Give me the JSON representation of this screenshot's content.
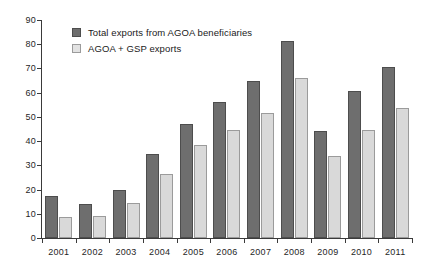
{
  "chart_data": {
    "type": "bar",
    "title": "",
    "subtitle": "",
    "xlabel": "",
    "ylabel": "",
    "categories": [
      "2001",
      "2002",
      "2003",
      "2004",
      "2005",
      "2006",
      "2007",
      "2008",
      "2009",
      "2010",
      "2011"
    ],
    "series": [
      {
        "name": "Total exports from AGOA beneficiaries",
        "color": "#6e6e6e",
        "values": [
          17.5,
          14,
          20,
          34.5,
          47,
          56,
          65,
          81.5,
          44,
          60.5,
          70.5
        ]
      },
      {
        "name": "AGOA + GSP exports",
        "color": "#d9d9d9",
        "values": [
          8.5,
          9,
          14.5,
          26.5,
          38.5,
          44.5,
          51.5,
          66,
          34,
          44.5,
          53.5
        ]
      }
    ],
    "ylim": [
      0,
      90
    ],
    "ytick_labels": [
      "90",
      "80",
      "70",
      "60",
      "50",
      "40",
      "30",
      "20",
      "10",
      "0"
    ],
    "ytick_values": [
      90,
      80,
      70,
      60,
      50,
      40,
      30,
      20,
      10,
      0
    ],
    "grid": false,
    "legend_position": "top-left"
  },
  "legend": {
    "items": [
      {
        "label": "Total exports from AGOA beneficiaries",
        "swatch": "dark"
      },
      {
        "label": "AGOA + GSP exports",
        "swatch": "light"
      }
    ]
  }
}
